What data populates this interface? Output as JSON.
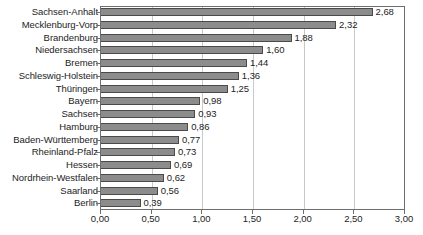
{
  "chart_data": {
    "type": "bar",
    "orientation": "horizontal",
    "title": "",
    "subtitle": "",
    "xlabel": "",
    "ylabel": "",
    "xlim": [
      0,
      3
    ],
    "grid": true,
    "legend": "none",
    "xticks": [
      "0,00",
      "0,50",
      "1,00",
      "1,50",
      "2,00",
      "2,50",
      "3,00"
    ],
    "xtick_values": [
      0,
      0.5,
      1,
      1.5,
      2,
      2.5,
      3
    ],
    "decimal_separator": ",",
    "bar_color": "#8c8c8c",
    "bar_border_color": "#4a4a4a",
    "gridline_color": "#c9c9c9",
    "axis_color": "#6e6e6e",
    "categories": [
      "Sachsen-Anhalt",
      "Mecklenburg-Vorp",
      "Brandenburg",
      "Niedersachsen",
      "Bremen",
      "Schleswig-Holstein",
      "Thüringen",
      "Bayern",
      "Sachsen",
      "Hamburg",
      "Baden-Württemberg",
      "Rheinland-Pfalz",
      "Hessen",
      "Nordrhein-Westfalen",
      "Saarland",
      "Berlin"
    ],
    "values": [
      2.68,
      2.32,
      1.88,
      1.6,
      1.44,
      1.36,
      1.25,
      0.98,
      0.93,
      0.86,
      0.77,
      0.73,
      0.69,
      0.62,
      0.56,
      0.39
    ],
    "value_labels": [
      "2,68",
      "2,32",
      "1,88",
      "1,60",
      "1,44",
      "1,36",
      "1,25",
      "0,98",
      "0,93",
      "0,86",
      "0,77",
      "0,73",
      "0,69",
      "0,62",
      "0,56",
      "0,39"
    ]
  }
}
